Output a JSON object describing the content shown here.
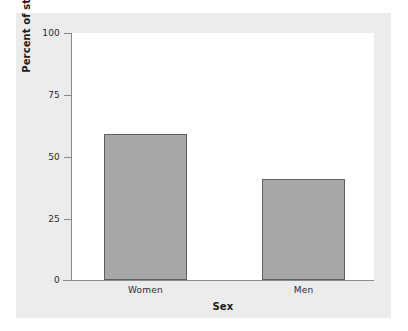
{
  "chart_data": {
    "type": "bar",
    "title": "",
    "subtitle": "",
    "categories": [
      "Women",
      "Men"
    ],
    "values": [
      59,
      41
    ],
    "series": [
      {
        "name": "Percent of students",
        "values": [
          59,
          41
        ]
      }
    ],
    "xlabel": "Sex",
    "ylabel": "Percent of students",
    "ylim": [
      0,
      100
    ],
    "yticks": [
      0,
      25,
      50,
      75,
      100
    ],
    "ytick_labels": [
      "0",
      "25",
      "50",
      "75",
      "100"
    ],
    "grid": false,
    "legend": false,
    "legend_position": "none",
    "bar_fill_color": "#a8a8a8",
    "bar_edge_color": "#5e5e5e",
    "plot_background_color": "#ffffff",
    "panel_background_color": "#ececed",
    "axis_color": "#8a8a8e",
    "text_color": "#2b2b2b"
  },
  "axes": {
    "y_title": "Percent of students",
    "x_title": "Sex",
    "ticks": [
      {
        "label": "100",
        "value": 100
      },
      {
        "label": "75",
        "value": 75
      },
      {
        "label": "50",
        "value": 50
      },
      {
        "label": "25",
        "value": 25
      },
      {
        "label": "0",
        "value": 0
      }
    ],
    "categories": [
      {
        "label": "Women",
        "value": 59
      },
      {
        "label": "Men",
        "value": 41
      }
    ]
  }
}
